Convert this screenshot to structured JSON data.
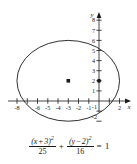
{
  "figure": {
    "kind": "ellipse-graph",
    "axis": {
      "x_label": "x",
      "y_label": "y",
      "x_ticks": [
        {
          "value": -8,
          "label": "-8"
        },
        {
          "value": -7,
          "label": ""
        },
        {
          "value": -6,
          "label": "-6"
        },
        {
          "value": -5,
          "label": "-5"
        },
        {
          "value": -4,
          "label": "-4"
        },
        {
          "value": -3,
          "label": "-3"
        },
        {
          "value": -2,
          "label": "-2"
        },
        {
          "value": -1,
          "label": "-1"
        },
        {
          "value": 1,
          "label": ""
        },
        {
          "value": 2,
          "label": "2"
        }
      ],
      "y_ticks": [
        {
          "value": 8,
          "label": "8"
        },
        {
          "value": 7,
          "label": "7"
        },
        {
          "value": 6,
          "label": "6"
        },
        {
          "value": 5,
          "label": "5"
        },
        {
          "value": 4,
          "label": "4"
        },
        {
          "value": 3,
          "label": "3"
        },
        {
          "value": 2,
          "label": "2"
        },
        {
          "value": 1,
          "label": "1"
        },
        {
          "value": -1,
          "label": "-1"
        },
        {
          "value": -2,
          "label": "-2"
        }
      ],
      "x_range": [
        -9.0,
        3.7
      ],
      "y_range": [
        -2.9,
        8.9
      ],
      "grid": false
    },
    "curve": {
      "type": "ellipse",
      "center": [
        -3,
        2
      ],
      "semi_axis_x": 5,
      "semi_axis_y": 4,
      "stroke": "#1a1a1a"
    },
    "points": [
      {
        "name": "center-point",
        "x": -3,
        "y": 2
      },
      {
        "name": "y-axis-point",
        "x": 0,
        "y": 2
      }
    ]
  },
  "equation": {
    "term1": {
      "numerator_open": "(",
      "numerator_var": "x",
      "numerator_op": "+",
      "numerator_const": "3",
      "numerator_close": ")",
      "numerator_exp": "2",
      "denominator": "25"
    },
    "plus": "+",
    "term2": {
      "numerator_open": "(",
      "numerator_var": "y",
      "numerator_op": "−",
      "numerator_const": "2",
      "numerator_close": ")",
      "numerator_exp": "2",
      "denominator": "16"
    },
    "equals": "=",
    "rhs": "1"
  },
  "colors": {
    "ink": "#1a1a1a",
    "background": "#ffffff"
  }
}
